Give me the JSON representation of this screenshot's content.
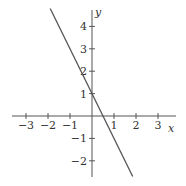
{
  "chart_data": {
    "type": "line",
    "title": "",
    "xlabel": "x",
    "ylabel": "y",
    "xlim": [
      -3.5,
      3.5
    ],
    "ylim": [
      -2.7,
      4.8
    ],
    "grid": false,
    "x_ticks": [
      -3,
      -2,
      -1,
      1,
      2,
      3
    ],
    "y_ticks": [
      -2,
      -1,
      1,
      2,
      3,
      4
    ],
    "x_tick_labels": [
      "−3",
      "−2",
      "−1",
      "1",
      "2",
      "3"
    ],
    "y_tick_labels": [
      "−2",
      "−1",
      "1",
      "2",
      "3",
      "4"
    ],
    "series": [
      {
        "name": "y = -2x + 1",
        "equation": "y = -2x + 1",
        "x": [
          -1.9,
          1.85
        ],
        "y": [
          4.8,
          -2.7
        ],
        "slope": -2,
        "y_intercept": 1,
        "x_intercept": 0.5,
        "color": "#555555"
      }
    ]
  },
  "axes": {
    "x_label": "x",
    "y_label": "y"
  }
}
